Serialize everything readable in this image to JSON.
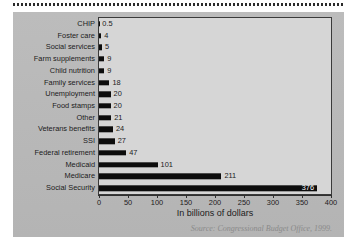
{
  "chart_data": {
    "type": "bar",
    "orientation": "horizontal",
    "title": "",
    "xlabel": "In billions of dollars",
    "ylabel": "",
    "xlim": [
      0,
      400
    ],
    "xticks": [
      0,
      50,
      100,
      150,
      200,
      250,
      300,
      350,
      400
    ],
    "xtick_labels": [
      "0",
      "50",
      "100",
      "150",
      "200",
      "250",
      "300",
      "350",
      "400"
    ],
    "grid": false,
    "legend": null,
    "source_note": "Source: Congressional Budget Office, 1999.",
    "categories": [
      "CHIP",
      "Foster care",
      "Social services",
      "Farm supplements",
      "Child nutrition",
      "Family services",
      "Unemployment",
      "Food stamps",
      "Other",
      "Veterans benefits",
      "SSI",
      "Federal retirement",
      "Medicaid",
      "Medicare",
      "Social Security"
    ],
    "values": [
      0.5,
      4,
      5,
      9,
      9,
      18,
      20,
      20,
      21,
      24,
      27,
      47,
      101,
      211,
      376
    ],
    "value_labels": [
      "0.5",
      "4",
      "5",
      "9",
      "9",
      "18",
      "20",
      "20",
      "21",
      "24",
      "27",
      "47",
      "101",
      "211",
      "376"
    ]
  },
  "style": {
    "bar_color": "#0d0d0d",
    "plot_background": "#d6d6d6",
    "card_background": "#b9b9b9",
    "axis_color": "#2f2f2f",
    "text_color": "#1b1b1b",
    "source_color": "#8a8a8a"
  }
}
